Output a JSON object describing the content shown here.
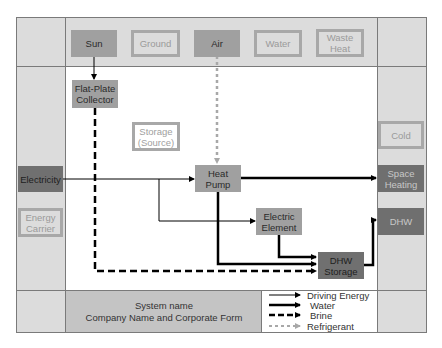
{
  "sources": {
    "sun": "Sun",
    "ground": "Ground",
    "air": "Air",
    "water": "Water",
    "waste_heat": "Waste Heat"
  },
  "components": {
    "collector": "Flat-Plate Collector",
    "storage_source": "Storage (Source)",
    "heat_pump": "Heat Pump",
    "electric_element": "Electric Element",
    "dhw_storage": "DHW Storage"
  },
  "energy": {
    "electricity": "Electricity",
    "energy_carrier": "Energy Carrier"
  },
  "sinks": {
    "cold": "Cold",
    "space_heating": "Space Heating",
    "dhw": "DHW"
  },
  "footer": {
    "system_name": "System name",
    "company": "Company Name and Corporate Form"
  },
  "legend": {
    "driving_energy": "Driving Energy",
    "water": "Water",
    "brine": "Brine",
    "refrigerant": "Refrigerant"
  },
  "colors": {
    "frame_bg": "#dcdcdc",
    "node_mid": "#a0a0a0",
    "node_dark": "#707070",
    "refrigerant": "#a8a8a8",
    "line": "#000000"
  }
}
